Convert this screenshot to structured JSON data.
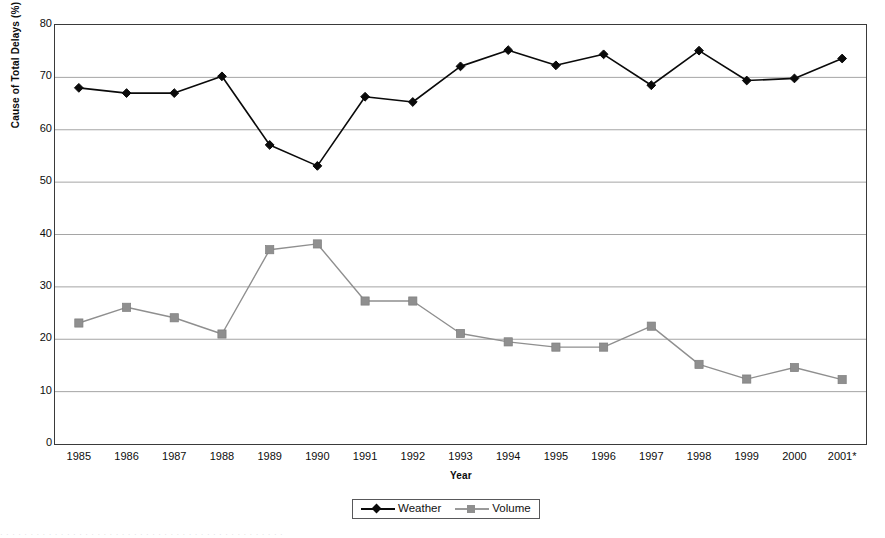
{
  "chart_data": {
    "type": "line",
    "title": "",
    "xlabel": "Year",
    "ylabel": "Cause of Total Delays (%)",
    "categories": [
      "1985",
      "1986",
      "1987",
      "1988",
      "1989",
      "1990",
      "1991",
      "1992",
      "1993",
      "1994",
      "1995",
      "1996",
      "1997",
      "1998",
      "1999",
      "2000",
      "2001*"
    ],
    "ylim": [
      0,
      80
    ],
    "ytick_step": 10,
    "yticks": [
      "80",
      "70",
      "60",
      "50",
      "40",
      "30",
      "20",
      "10",
      "0"
    ],
    "grid": "horizontal",
    "legend_position": "bottom-center",
    "series": [
      {
        "name": "Weather",
        "color": "#0a0a0a",
        "marker": "diamond",
        "values": [
          68.0,
          67.0,
          67.0,
          70.2,
          57.1,
          53.1,
          66.3,
          65.3,
          72.1,
          75.2,
          72.3,
          74.4,
          68.5,
          75.1,
          69.4,
          69.8,
          73.6
        ]
      },
      {
        "name": "Volume",
        "color": "#8f8f8f",
        "marker": "square",
        "values": [
          23.1,
          26.1,
          24.1,
          21.0,
          37.1,
          38.2,
          27.3,
          27.3,
          21.1,
          19.5,
          18.5,
          18.5,
          22.5,
          15.2,
          12.4,
          14.6,
          12.3
        ]
      }
    ]
  },
  "legend": {
    "entries": [
      {
        "label": "Weather"
      },
      {
        "label": "Volume"
      }
    ]
  },
  "footer": {
    "smudge_text": "· ·   ·  ·    ·   ·  ·     ·    ·  ·   ·   ·    ·  ·  ·   ·    ·   ·  ·   ·    ·  ·   ·   ·  ·    ·   ·   ·  ·   ·    ·  ·   ·   ·  ·   ·    ·  ·   ·   ·   ·  ·    ·  ·   ·   ·  ·"
  }
}
